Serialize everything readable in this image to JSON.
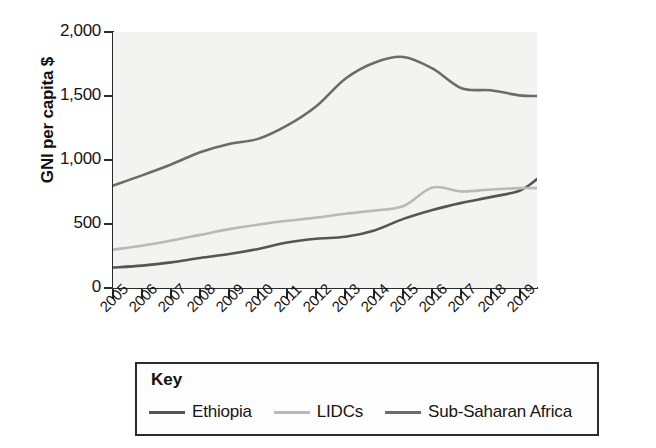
{
  "chart_data": {
    "type": "line",
    "title": "",
    "subtitle": "",
    "xlabel": "",
    "ylabel": "GNI per capita $",
    "x": [
      2005,
      2006,
      2007,
      2008,
      2009,
      2010,
      2011,
      2012,
      2013,
      2014,
      2015,
      2016,
      2017,
      2018,
      2019
    ],
    "categories": [
      "2005",
      "2006",
      "2007",
      "2008",
      "2009",
      "2010",
      "2011",
      "2012",
      "2013",
      "2014",
      "2015",
      "2016",
      "2017",
      "2018",
      "2019"
    ],
    "xlim": [
      2005,
      2019.6
    ],
    "ylim": [
      0,
      2000
    ],
    "yticks": [
      0,
      500,
      1000,
      1500,
      2000
    ],
    "ytick_labels": [
      "0",
      "500",
      "1,000",
      "1,500",
      "2,000"
    ],
    "grid": false,
    "legend_position": "below-plot",
    "legend_title": "Key",
    "series": [
      {
        "name": "Ethiopia",
        "color": "#555555",
        "values": [
          160,
          175,
          200,
          235,
          265,
          305,
          355,
          385,
          400,
          450,
          540,
          610,
          665,
          710,
          760
        ]
      },
      {
        "name": "LIDCs",
        "color": "#b9b9b9",
        "values": [
          300,
          330,
          370,
          415,
          460,
          495,
          525,
          550,
          580,
          605,
          640,
          785,
          755,
          770,
          780
        ]
      },
      {
        "name": "Sub-Saharan Africa",
        "color": "#6b6b6b",
        "values": [
          800,
          880,
          965,
          1060,
          1125,
          1165,
          1270,
          1420,
          1635,
          1760,
          1805,
          1715,
          1560,
          1545,
          1505
        ]
      }
    ],
    "series_end_extension": {
      "Ethiopia": 850,
      "LIDCs": 780,
      "Sub-Saharan Africa": 1500
    }
  },
  "legend": {
    "title": "Key",
    "items": [
      {
        "label": "Ethiopia",
        "color": "#555555"
      },
      {
        "label": "LIDCs",
        "color": "#b9b9b9"
      },
      {
        "label": "Sub-Saharan Africa",
        "color": "#6b6b6b"
      }
    ]
  },
  "axes": {
    "y_title": "GNI per capita $",
    "y_tick_labels": [
      "2,000",
      "1,500",
      "1,000",
      "500",
      "0"
    ],
    "x_tick_labels": [
      "2005",
      "2006",
      "2007",
      "2008",
      "2009",
      "2010",
      "2011",
      "2012",
      "2013",
      "2014",
      "2015",
      "2016",
      "2017",
      "2018",
      "2019"
    ]
  },
  "colors": {
    "axis": "#2b2b2b",
    "plot_background": "#f3f3f1",
    "page_background": "#ffffff",
    "text": "#151515"
  }
}
